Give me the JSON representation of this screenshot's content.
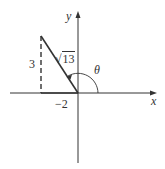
{
  "diagram": {
    "type": "unit-circle-reference-triangle",
    "axes": {
      "x_label": "x",
      "y_label": "y"
    },
    "point": {
      "x": -2,
      "y": 3
    },
    "labels": {
      "vertical_leg": "3",
      "horizontal_leg": "−2",
      "hypotenuse_radicand": "13",
      "hypotenuse_symbol": "√",
      "angle": "θ"
    },
    "colors": {
      "stroke": "#333333",
      "background": "#ffffff"
    }
  }
}
